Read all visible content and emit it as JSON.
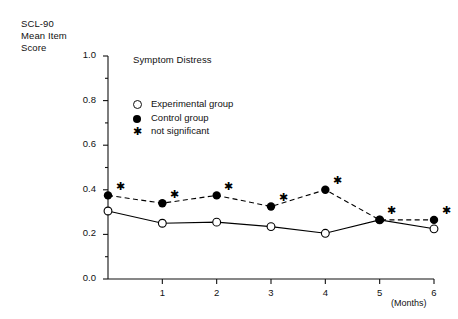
{
  "figure": {
    "y_axis_title_lines": [
      "SCL-90",
      "Mean Item",
      "Score"
    ],
    "plot_title": "Symptom Distress",
    "x_axis_unit_label": "(Months)"
  },
  "legend": {
    "items": [
      {
        "marker": "open-circle",
        "label": "Experimental group"
      },
      {
        "marker": "filled-circle",
        "label": "Control group"
      },
      {
        "marker": "star",
        "label": "not significant"
      }
    ]
  },
  "chart_data": {
    "type": "line",
    "title": "Symptom Distress",
    "xlabel": "(Months)",
    "ylabel": "SCL-90 Mean Item Score",
    "x": [
      0,
      1,
      2,
      3,
      4,
      5,
      6
    ],
    "xlim": [
      0,
      6
    ],
    "ylim": [
      0.0,
      1.0
    ],
    "xtick_labels": [
      "1",
      "2",
      "3",
      "4",
      "5",
      "6"
    ],
    "xticks": [
      1,
      2,
      3,
      4,
      5,
      6
    ],
    "ytick_labels": [
      "0.0",
      "0.2",
      "0.4",
      "0.6",
      "0.8",
      "1.0"
    ],
    "yticks": [
      0.0,
      0.2,
      0.4,
      0.6,
      0.8,
      1.0
    ],
    "y_minor_ticks": [
      0.1,
      0.3,
      0.5,
      0.7,
      0.9
    ],
    "grid": false,
    "legend_position": "upper-left-inside",
    "series": [
      {
        "name": "Experimental group",
        "marker": "open-circle",
        "line_style": "solid",
        "values": [
          0.305,
          0.25,
          0.255,
          0.235,
          0.205,
          0.265,
          0.225
        ]
      },
      {
        "name": "Control group",
        "marker": "filled-circle",
        "line_style": "dashed",
        "values": [
          0.375,
          0.34,
          0.375,
          0.325,
          0.4,
          0.265,
          0.265
        ]
      }
    ],
    "annotations": {
      "symbol": "star",
      "meaning": "not significant",
      "on_series": "Control group",
      "at_x": [
        0,
        1,
        2,
        3,
        4,
        5,
        6
      ]
    }
  },
  "colors": {
    "axis": "#111111",
    "control": "#000000",
    "experimental": "#000000",
    "background": "#ffffff"
  }
}
